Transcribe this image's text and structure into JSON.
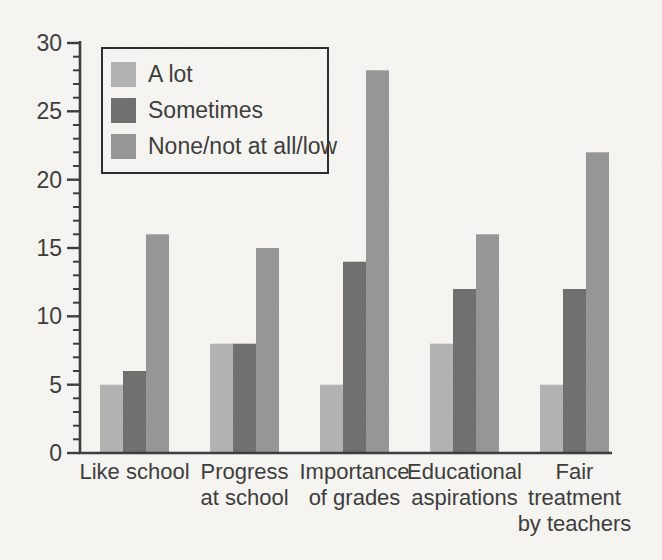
{
  "chart_data": {
    "type": "bar",
    "title": "",
    "xlabel": "",
    "ylabel": "",
    "categories": [
      "Like school",
      "Progress at school",
      "Importance of grades",
      "Educational aspirations",
      "Fair treatment by teachers"
    ],
    "category_label_lines": [
      [
        "Like school"
      ],
      [
        "Progress",
        "at school"
      ],
      [
        "Importance",
        "of grades"
      ],
      [
        "Educational",
        "aspirations"
      ],
      [
        "Fair",
        "treatment",
        "by teachers"
      ]
    ],
    "series": [
      {
        "name": "A lot",
        "color": "#b2b2b2",
        "values": [
          5,
          8,
          5,
          8,
          5
        ]
      },
      {
        "name": "Sometimes",
        "color": "#6e6e6e",
        "values": [
          6,
          8,
          14,
          12,
          12
        ]
      },
      {
        "name": "None/not at all/low",
        "color": "#959595",
        "values": [
          16,
          15,
          28,
          16,
          22
        ]
      }
    ],
    "ylim": [
      0,
      30
    ],
    "yticks": [
      0,
      5,
      10,
      15,
      20,
      25,
      30
    ],
    "minor_tick_step": 1,
    "grid": false,
    "legend_position": "top-left"
  },
  "colors": {
    "background": "#f6f5f1",
    "axis": "#3a3a3a",
    "tick": "#3a3a3a",
    "text": "#3a3a3a",
    "legend_border": "#2a2a2a",
    "legend_fill": "#f6f5f1"
  }
}
